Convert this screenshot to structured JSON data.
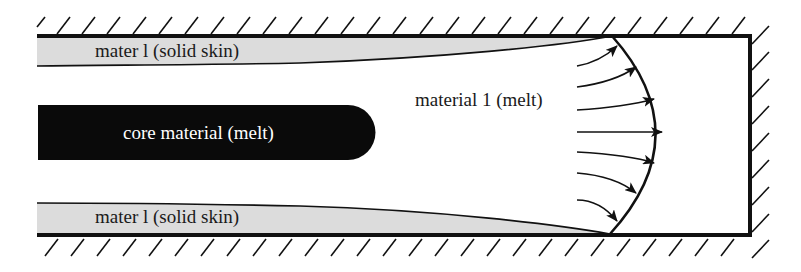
{
  "diagram": {
    "labels": {
      "top_skin": "mater l (solid skin)",
      "bottom_skin": "mater l (solid skin)",
      "core": "core material (melt)",
      "melt": "material 1 (melt)"
    },
    "colors": {
      "wall": "#111111",
      "skin_fill": "#dcdcdc",
      "core_fill": "#0a0a0a",
      "core_text": "#ffffff",
      "text": "#1a1a1a",
      "background": "#ffffff"
    },
    "arrows": {
      "count": 7,
      "description": "fountain flow velocity arrows toward flow front"
    }
  }
}
